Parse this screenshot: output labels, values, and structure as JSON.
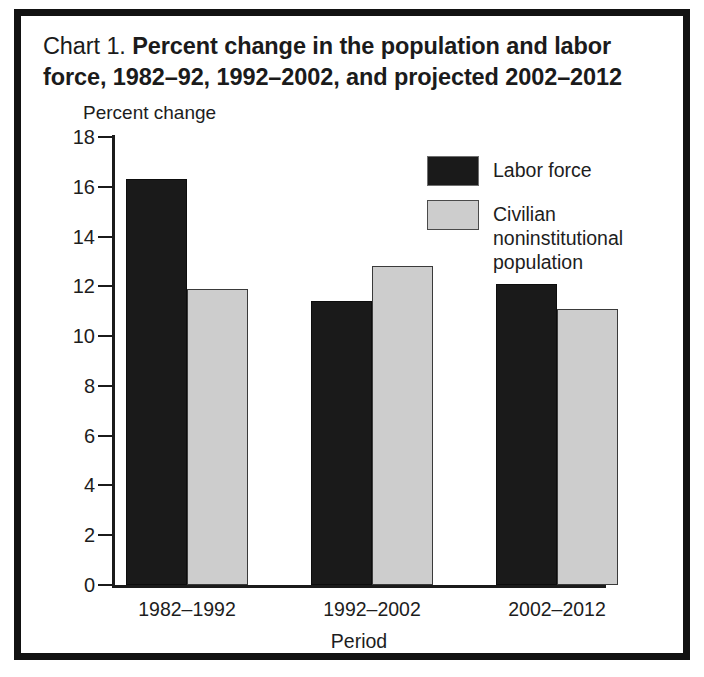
{
  "figure": {
    "title_lead": "Chart 1.",
    "title_main": "Percent change in the population and labor force, 1982–92, 1992–2002, and projected 2002–2012"
  },
  "colors": {
    "labor_force": "#1a1a1a",
    "population": "#cdcdcd",
    "axis": "#1b1b1b",
    "frame": "#121212",
    "text": "#1d1d1d"
  },
  "legend": {
    "position": "inside-top-right",
    "entries": [
      {
        "label": "Labor force",
        "swatch": "dark"
      },
      {
        "label": "Civilian noninstitutional population",
        "swatch": "light"
      }
    ]
  },
  "axes": {
    "y_tick_labels": [
      "18",
      "16",
      "14",
      "12",
      "10",
      "8",
      "6",
      "4",
      "2",
      "0"
    ],
    "x_tick_labels": [
      "1982–1992",
      "1992–2002",
      "2002–2012"
    ]
  },
  "chart_data": {
    "type": "bar",
    "title": "Chart 1. Percent change in the population and labor force, 1982–92, 1992–2002, and projected 2002–2012",
    "xlabel": "Period",
    "ylabel": "Percent change",
    "ylim": [
      0,
      18
    ],
    "ytick_step": 2,
    "yticks": [
      0,
      2,
      4,
      6,
      8,
      10,
      12,
      14,
      16,
      18
    ],
    "grid": false,
    "legend_position": "inside-top-right",
    "categories": [
      "1982–1992",
      "1992–2002",
      "2002–2012"
    ],
    "series": [
      {
        "name": "Labor force",
        "color": "#1a1a1a",
        "values": [
          16.3,
          11.4,
          12.1
        ]
      },
      {
        "name": "Civilian noninstitutional population",
        "color": "#cdcdcd",
        "values": [
          11.9,
          12.8,
          11.1
        ]
      }
    ]
  }
}
